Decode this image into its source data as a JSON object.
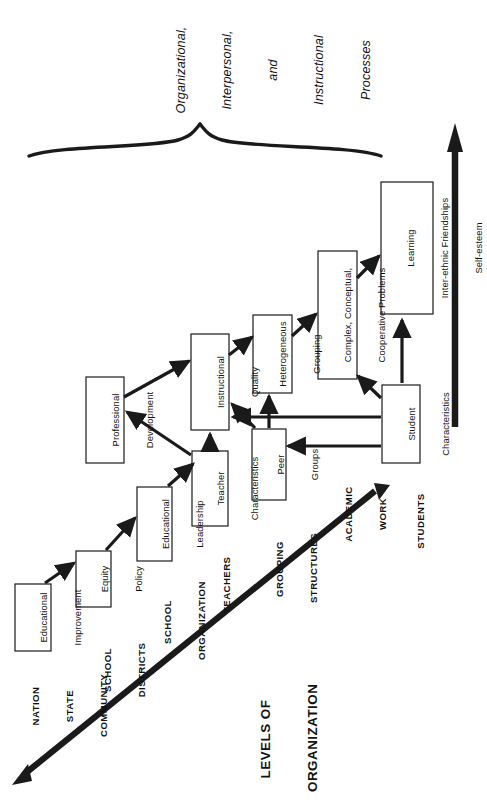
{
  "diagram": {
    "title_lines": [
      "Organizational,",
      "Interpersonal,",
      "and",
      "Instructional",
      "Processes"
    ],
    "axis_label_lines": [
      "LEVELS OF",
      "ORGANIZATION"
    ],
    "boxes": [
      {
        "id": "educational-improvement",
        "lines": [
          "Educational",
          "Improvement"
        ]
      },
      {
        "id": "equity-policy",
        "lines": [
          "Equity",
          "Policy"
        ]
      },
      {
        "id": "educational-leadership",
        "lines": [
          "Educational",
          "Leadership"
        ]
      },
      {
        "id": "teacher-characteristics",
        "lines": [
          "Teacher",
          "Characteristics"
        ]
      },
      {
        "id": "professional-development",
        "lines": [
          "Professional",
          "Development"
        ]
      },
      {
        "id": "instructional-quality",
        "lines": [
          "Instructional",
          "Quality"
        ]
      },
      {
        "id": "peer-groups",
        "lines": [
          "Peer",
          "Groups"
        ]
      },
      {
        "id": "heterogeneous-grouping",
        "lines": [
          "Heterogeneous",
          "Grouping"
        ]
      },
      {
        "id": "student-characteristics",
        "lines": [
          "Student",
          "Characteristics"
        ]
      },
      {
        "id": "complex-cooperative-problems",
        "lines": [
          "Complex, Conceptual,",
          "Cooperative Problems"
        ]
      },
      {
        "id": "outcomes",
        "lines": [
          "Learning",
          "Inter-ethnic Friendships",
          "Self-esteem"
        ]
      }
    ],
    "levels": [
      {
        "id": "nation-state-community",
        "lines": [
          "NATION",
          "STATE",
          "COMMUNITY"
        ]
      },
      {
        "id": "school-districts",
        "lines": [
          "SCHOOL",
          "DISTRICTS"
        ]
      },
      {
        "id": "school-organization",
        "lines": [
          "SCHOOL",
          "ORGANIZATION"
        ]
      },
      {
        "id": "teachers",
        "lines": [
          "TEACHERS"
        ]
      },
      {
        "id": "grouping-structures",
        "lines": [
          "GROUPING",
          "STRUCTURES"
        ]
      },
      {
        "id": "academic-work",
        "lines": [
          "ACADEMIC",
          "WORK"
        ]
      },
      {
        "id": "students",
        "lines": [
          "STUDENTS"
        ]
      }
    ],
    "colors": {
      "ink": "#1a1a1a",
      "background": "#ffffff"
    }
  }
}
